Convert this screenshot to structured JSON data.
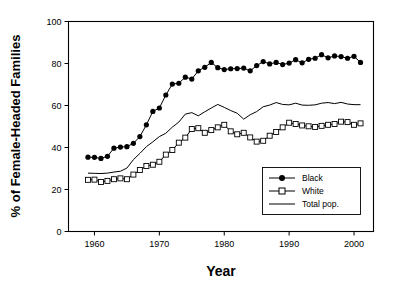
{
  "chart_data": {
    "type": "line",
    "title": "",
    "xlabel": "Year",
    "ylabel": "% of Female-Headed Families",
    "xlim": [
      1956,
      2003
    ],
    "ylim": [
      0,
      100
    ],
    "grid": false,
    "legend_position": "bottom-right",
    "xticks": [
      1960,
      1970,
      1980,
      1990,
      2000
    ],
    "yticks": [
      0,
      20,
      40,
      60,
      80,
      100
    ],
    "x": [
      1959,
      1960,
      1961,
      1962,
      1963,
      1964,
      1965,
      1966,
      1967,
      1968,
      1969,
      1970,
      1971,
      1972,
      1973,
      1974,
      1975,
      1976,
      1977,
      1978,
      1979,
      1980,
      1981,
      1982,
      1983,
      1984,
      1985,
      1986,
      1987,
      1988,
      1989,
      1990,
      1991,
      1992,
      1993,
      1994,
      1995,
      1996,
      1997,
      1998,
      1999,
      2000,
      2001
    ],
    "series": [
      {
        "name": "Black",
        "marker": "filled-circle",
        "values": [
          35.4,
          35.3,
          34.8,
          35.8,
          39.7,
          40.2,
          40.4,
          42.0,
          45.2,
          50.8,
          57.2,
          58.8,
          65.0,
          70.2,
          70.6,
          73.5,
          72.6,
          76.5,
          78.2,
          80.5,
          78.0,
          77.1,
          77.5,
          77.6,
          77.8,
          76.5,
          79.0,
          80.9,
          79.8,
          80.5,
          79.5,
          80.2,
          81.8,
          80.3,
          82.0,
          82.5,
          84.2,
          82.7,
          83.6,
          83.3,
          82.5,
          83.4,
          80.5
        ]
      },
      {
        "name": "White",
        "marker": "open-square",
        "values": [
          24.6,
          24.7,
          23.6,
          24.1,
          24.9,
          25.3,
          24.9,
          27.1,
          29.3,
          31.2,
          31.8,
          33.2,
          36.6,
          38.8,
          42.3,
          44.7,
          48.8,
          49.2,
          47.0,
          48.3,
          49.6,
          50.8,
          47.7,
          46.3,
          47.0,
          44.8,
          42.8,
          43.2,
          45.6,
          47.4,
          49.6,
          51.8,
          51.2,
          50.5,
          50.1,
          49.8,
          50.3,
          50.8,
          51.2,
          52.3,
          52.1,
          50.8,
          51.5
        ]
      },
      {
        "name": "Total pop.",
        "marker": "none",
        "values": [
          27.8,
          27.7,
          27.6,
          27.8,
          28.3,
          28.7,
          30.2,
          34.2,
          37.2,
          40.4,
          42.7,
          45.2,
          46.8,
          49.7,
          52.1,
          55.9,
          56.6,
          55.1,
          57.0,
          58.8,
          60.5,
          59.1,
          57.6,
          56.3,
          53.5,
          55.6,
          57.1,
          59.4,
          60.2,
          61.4,
          60.5,
          60.3,
          61.1,
          60.2,
          60.1,
          60.3,
          61.1,
          61.4,
          60.9,
          61.5,
          60.7,
          60.4,
          60.4
        ]
      }
    ],
    "legend": [
      {
        "label": "Black",
        "marker": "filled-circle"
      },
      {
        "label": "White",
        "marker": "open-square"
      },
      {
        "label": "Total pop.",
        "marker": "none"
      }
    ]
  }
}
